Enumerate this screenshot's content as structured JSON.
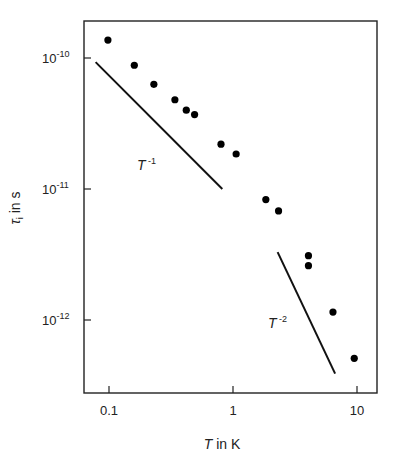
{
  "chart_data": {
    "type": "scatter",
    "title": "",
    "xlabel": "T in K",
    "ylabel": "τi in s",
    "xscale": "log",
    "yscale": "log",
    "xlim": [
      0.075,
      14
    ],
    "ylim": [
      2.8e-13,
      1.9e-10
    ],
    "grid": false,
    "legend": null,
    "x_ticks": [
      {
        "value": 0.1,
        "label": "0.1"
      },
      {
        "value": 1,
        "label": "1"
      },
      {
        "value": 10,
        "label": "10"
      }
    ],
    "y_ticks": [
      {
        "value": 1e-10,
        "base": "10",
        "exp": "-10"
      },
      {
        "value": 1e-11,
        "base": "10",
        "exp": "-11"
      },
      {
        "value": 1e-12,
        "base": "10",
        "exp": "-12"
      }
    ],
    "series": [
      {
        "name": "measured τi",
        "marker": "filled-circle",
        "points": [
          {
            "x": 0.098,
            "y": 1.37e-10
          },
          {
            "x": 0.16,
            "y": 8.8e-11
          },
          {
            "x": 0.23,
            "y": 6.3e-11
          },
          {
            "x": 0.34,
            "y": 4.8e-11
          },
          {
            "x": 0.42,
            "y": 4e-11
          },
          {
            "x": 0.49,
            "y": 3.7e-11
          },
          {
            "x": 0.8,
            "y": 2.2e-11
          },
          {
            "x": 1.06,
            "y": 1.85e-11
          },
          {
            "x": 1.84,
            "y": 8.3e-12
          },
          {
            "x": 2.33,
            "y": 6.8e-12
          },
          {
            "x": 4.06,
            "y": 3.1e-12
          },
          {
            "x": 4.06,
            "y": 2.6e-12
          },
          {
            "x": 6.4,
            "y": 1.15e-12
          },
          {
            "x": 9.5,
            "y": 5.1e-13
          }
        ]
      }
    ],
    "reference_lines": [
      {
        "name": "T^-1",
        "label_base": "T",
        "label_exp": "-1",
        "from": {
          "x": 0.078,
          "y": 9.3e-11
        },
        "to": {
          "x": 0.82,
          "y": 1e-11
        }
      },
      {
        "name": "T^-2",
        "label_base": "T",
        "label_exp": "-2",
        "from": {
          "x": 2.29,
          "y": 3.3e-12
        },
        "to": {
          "x": 6.66,
          "y": 3.9e-13
        }
      }
    ]
  },
  "labels": {
    "xlabel_T": "T",
    "xlabel_rest": " in K",
    "ylabel_tau": "τ",
    "ylabel_sub": "i",
    "ylabel_rest": " in s"
  }
}
